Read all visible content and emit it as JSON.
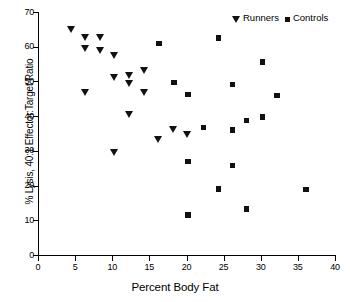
{
  "chart_data": {
    "type": "scatter",
    "title": "",
    "xlabel": "Percent Body Fat",
    "ylabel": "% Lysis, 40:1 Effector:Target Ratio",
    "xlim": [
      0,
      40
    ],
    "ylim": [
      0,
      70
    ],
    "xticks": [
      0,
      5,
      10,
      15,
      20,
      25,
      30,
      35,
      40
    ],
    "yticks": [
      0,
      10,
      20,
      30,
      40,
      50,
      60,
      70
    ],
    "grid": false,
    "legend_position": "top-right",
    "series": [
      {
        "name": "Runners",
        "marker": "triangle-down",
        "color": "#111111",
        "points": [
          [
            4.5,
            65.0
          ],
          [
            6.4,
            62.5
          ],
          [
            6.4,
            59.3
          ],
          [
            6.4,
            46.8
          ],
          [
            8.4,
            62.5
          ],
          [
            8.4,
            58.8
          ],
          [
            10.3,
            57.5
          ],
          [
            10.3,
            51.0
          ],
          [
            10.3,
            29.5
          ],
          [
            12.3,
            51.5
          ],
          [
            12.3,
            49.2
          ],
          [
            12.3,
            40.3
          ],
          [
            14.3,
            53.0
          ],
          [
            14.3,
            46.8
          ],
          [
            16.3,
            33.2
          ],
          [
            18.3,
            36.2
          ],
          [
            20.2,
            34.7
          ]
        ]
      },
      {
        "name": "Controls",
        "marker": "square",
        "color": "#111111",
        "points": [
          [
            16.3,
            61.0
          ],
          [
            18.3,
            49.7
          ],
          [
            20.2,
            46.3
          ],
          [
            20.2,
            27.0
          ],
          [
            20.2,
            11.5
          ],
          [
            22.3,
            36.8
          ],
          [
            24.3,
            62.5
          ],
          [
            24.3,
            19.0
          ],
          [
            26.2,
            49.2
          ],
          [
            26.2,
            36.0
          ],
          [
            26.2,
            25.8
          ],
          [
            28.1,
            38.8
          ],
          [
            28.1,
            13.3
          ],
          [
            30.2,
            55.6
          ],
          [
            30.2,
            39.7
          ],
          [
            32.2,
            45.9
          ],
          [
            36.1,
            18.9
          ]
        ]
      }
    ]
  },
  "legend": {
    "entries": [
      {
        "label": "Runners",
        "marker": "triangle-down"
      },
      {
        "label": "Controls",
        "marker": "square"
      }
    ]
  }
}
